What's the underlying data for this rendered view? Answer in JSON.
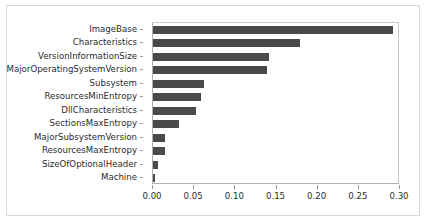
{
  "chart_data": {
    "type": "bar",
    "orientation": "horizontal",
    "title": "",
    "xlabel": "",
    "ylabel": "",
    "xlim": [
      0.0,
      0.3
    ],
    "xticks": [
      "0.00",
      "0.05",
      "0.10",
      "0.15",
      "0.20",
      "0.25",
      "0.30"
    ],
    "xtick_values": [
      0.0,
      0.05,
      0.1,
      0.15,
      0.2,
      0.25,
      0.3
    ],
    "grid": false,
    "legend": null,
    "bar_color": "#4a4a4a",
    "categories": [
      "ImageBase",
      "Characteristics",
      "VersionInformationSize",
      "MajorOperatingSystemVersion",
      "Subsystem",
      "ResourcesMinEntropy",
      "DllCharacteristics",
      "SectionsMaxEntropy",
      "MajorSubsystemVersion",
      "ResourcesMaxEntropy",
      "SizeOfOptionalHeader",
      "Machine"
    ],
    "values": [
      0.291,
      0.178,
      0.141,
      0.138,
      0.062,
      0.058,
      0.052,
      0.031,
      0.015,
      0.014,
      0.006,
      0.003
    ]
  }
}
